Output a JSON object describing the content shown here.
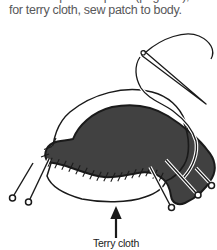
{
  "instruction": {
    "clipped_line_fragment": "stitch the patch in place (page 00);",
    "line": "for terry cloth, sew patch to body."
  },
  "figure": {
    "caption": "Terry cloth",
    "patch_fill_color": "#414141",
    "outline_color": "#1a1a1a",
    "body_fill_color": "#ffffff",
    "elements": "needle and thread whip-stitching a dark patch pinned to a terry cloth body, arrow pointing to body"
  }
}
